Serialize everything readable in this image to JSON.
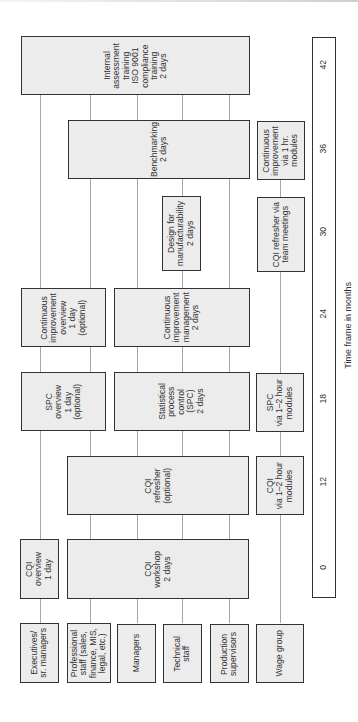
{
  "groups": [
    {
      "id": "executives",
      "label": "Executives/\nsr. managers"
    },
    {
      "id": "professional",
      "label": "Professional\nstaff (sales,\nfinance, MIS,\nlegal, etc.)"
    },
    {
      "id": "managers",
      "label": "Managers"
    },
    {
      "id": "technical",
      "label": "Technical\nstaff"
    },
    {
      "id": "production",
      "label": "Production\nsupervisors"
    },
    {
      "id": "wage",
      "label": "Wage group"
    }
  ],
  "trainings": {
    "cqi_overview": "CQI\noverview\n1 day",
    "cqi_workshop": "CQI\nworkshop\n2 days",
    "cqi_refresher": "CQI\nrefresher\n(optional)",
    "cqi_modules": "CQI\nvia 1–2 hour\nmodules",
    "spc_overview": "SPC\noverview\n1 day\n(optional)",
    "spc_training": "Statistical\nprocess\ncontrol\n(SPC)\n2 days",
    "spc_modules": "SPC\nvia 1–2 hour\nmodules",
    "ci_overview": "Continuous\nimprovement\noverview\n1 day\n(optional)",
    "ci_management": "Continuous\nimprovement\nmanagement\n2 days",
    "dfm": "Design for\nmanufacturability\n2 days",
    "cqi_team": "CQI refresher via\nteam meetings",
    "benchmarking": "Benchmarking\n2 days",
    "ci_modules": "Continuous\nimprovement\nvia 1 hr.\nmodules",
    "internal_assessment": "Internal\nassessment\ntraining\nISO 9001\ncompliance\ntraining\n2 days"
  },
  "timeline": {
    "ticks": [
      "0",
      "12",
      "18",
      "24",
      "30",
      "36",
      "42"
    ],
    "axis_label": "Time frame in months"
  },
  "colors": {
    "box_fill": "#ececec",
    "border": "#333333",
    "connector": "#a8a8a8"
  }
}
